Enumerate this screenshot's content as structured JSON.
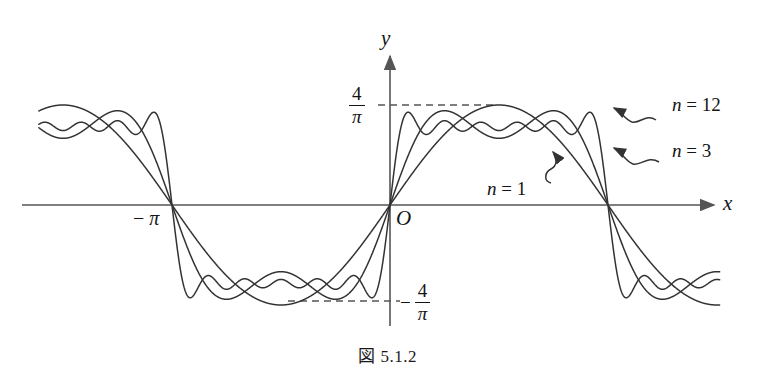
{
  "figure": {
    "caption": "図 5.1.2",
    "background_color": "#ffffff",
    "curve_color": "#333333",
    "axis_color": "#555555",
    "dash_color": "#555555"
  },
  "axes": {
    "x_label": "x",
    "y_label": "y",
    "origin_label": "O",
    "x_tick_left": {
      "sign": "−",
      "symbol": "π"
    },
    "y_tick_positive": {
      "numerator": "4",
      "denominator": "π"
    },
    "y_tick_negative": {
      "sign": "−",
      "numerator": "4",
      "denominator": "π"
    }
  },
  "series_labels": [
    {
      "name": "n-12",
      "lhs": "n",
      "eq": "=",
      "rhs": "12"
    },
    {
      "name": "n-3",
      "lhs": "n",
      "eq": "=",
      "rhs": "3"
    },
    {
      "name": "n-1",
      "lhs": "n",
      "eq": "=",
      "rhs": "1"
    }
  ],
  "chart_data": {
    "type": "line",
    "title": "図 5.1.2",
    "xlabel": "x",
    "ylabel": "y",
    "grid": false,
    "legend": "inline-annotations",
    "xlim": [
      -5.06,
      4.75
    ],
    "ylim": [
      -1.55,
      1.55
    ],
    "xticks": [
      {
        "value": -3.14159,
        "label": "−π"
      },
      {
        "value": 0,
        "label": "O"
      }
    ],
    "yticks": [
      {
        "value": 1.0,
        "label": "4/π"
      },
      {
        "value": -1.0,
        "label": "−4/π"
      }
    ],
    "reference_lines": [
      {
        "orientation": "horizontal",
        "value": 1.0,
        "style": "dashed",
        "label": "4/π"
      },
      {
        "orientation": "horizontal",
        "value": -1.0,
        "style": "dashed",
        "label": "−4/π"
      }
    ],
    "series": [
      {
        "name": "n = 1",
        "n": 1,
        "harmonics": [
          1
        ],
        "formula": "sin(x)",
        "peak_value": 1.0,
        "color": "#333333"
      },
      {
        "name": "n = 3",
        "n": 3,
        "harmonics": [
          1,
          3
        ],
        "formula": "sin(x) + sin(3x)/3",
        "peak_value": 1.15,
        "color": "#333333"
      },
      {
        "name": "n = 12",
        "n": 12,
        "harmonics": [
          1,
          3,
          5,
          7,
          9,
          11
        ],
        "formula": "sin(x) + sin(3x)/3 + sin(5x)/5 + sin(7x)/7 + sin(9x)/9 + sin(11x)/11",
        "peak_value": 1.17,
        "color": "#333333"
      }
    ],
    "annotations": [
      {
        "text": "n = 12",
        "points_to_series": "n = 12"
      },
      {
        "text": "n = 3",
        "points_to_series": "n = 3"
      },
      {
        "text": "n = 1",
        "points_to_series": "n = 1"
      }
    ]
  }
}
